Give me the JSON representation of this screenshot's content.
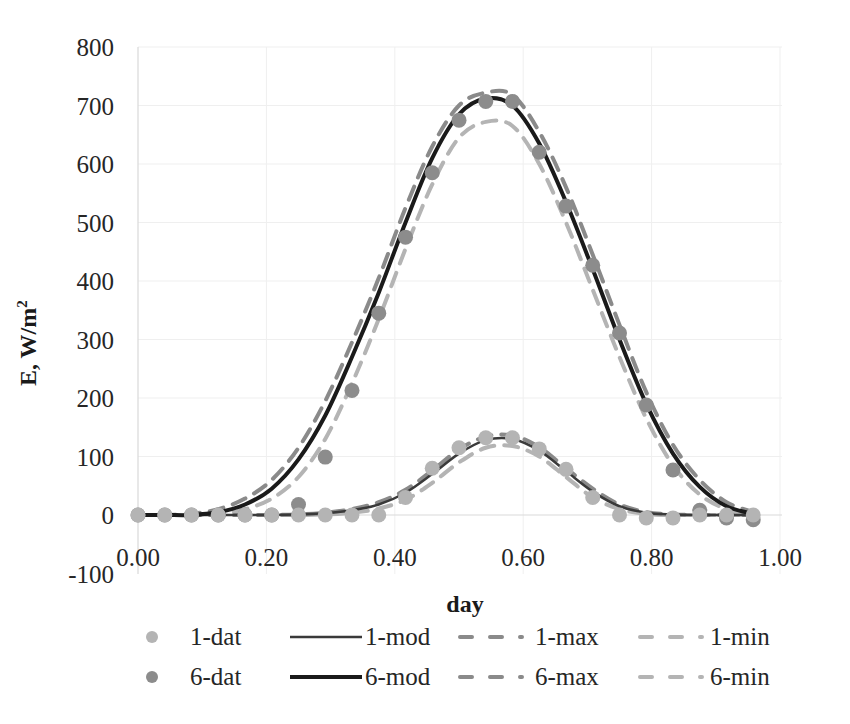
{
  "chart_data": {
    "type": "line",
    "title": "",
    "xlabel": "day",
    "ylabel": "E, W/m²",
    "xlim": [
      0,
      1
    ],
    "ylim": [
      -100,
      800
    ],
    "grid": true,
    "legend_position": "bottom",
    "x_ticks": [
      "0.00",
      "0.20",
      "0.40",
      "0.60",
      "0.80",
      "1.00"
    ],
    "y_ticks": [
      "-100",
      "0",
      "100",
      "200",
      "300",
      "400",
      "500",
      "600",
      "700",
      "800"
    ],
    "x": [
      0,
      0.0417,
      0.0833,
      0.125,
      0.1667,
      0.2083,
      0.25,
      0.2917,
      0.3333,
      0.375,
      0.4167,
      0.4583,
      0.5,
      0.5417,
      0.5833,
      0.625,
      0.6667,
      0.7083,
      0.75,
      0.7917,
      0.8333,
      0.875,
      0.9167,
      0.9583
    ],
    "series": [
      {
        "name": "1-dat",
        "kind": "markers",
        "color": "#b4b4b4",
        "values": [
          0,
          0,
          0,
          0,
          0,
          0,
          0,
          0,
          0,
          0,
          30,
          80,
          115,
          132,
          132,
          113,
          78,
          30,
          0,
          -5,
          -5,
          0,
          0,
          0
        ]
      },
      {
        "name": "6-dat",
        "kind": "markers",
        "color": "#8c8c8c",
        "values": [
          0,
          0,
          0,
          0,
          0,
          0,
          18,
          0,
          0,
          0,
          0,
          0,
          0,
          0,
          0,
          0,
          0,
          0,
          0,
          0,
          0,
          0,
          0,
          0
        ],
        "values_main": [
          0,
          0,
          0,
          0,
          0,
          0,
          18,
          99,
          213,
          345,
          475,
          585,
          675,
          707,
          707,
          620,
          528,
          427,
          311,
          188,
          77,
          8,
          -5,
          -8
        ]
      },
      {
        "name": "1-mod",
        "kind": "solid",
        "color": "#3a3a3a",
        "width": 2.5,
        "values": [
          0,
          0,
          0,
          0,
          0,
          0,
          1,
          3,
          8,
          18,
          38,
          70,
          105,
          128,
          130,
          110,
          75,
          40,
          15,
          4,
          1,
          0,
          0,
          0
        ]
      },
      {
        "name": "6-mod",
        "kind": "solid",
        "color": "#1a1a1a",
        "width": 4,
        "values": [
          0,
          0,
          0,
          5,
          18,
          45,
          95,
          170,
          270,
          380,
          500,
          610,
          685,
          712,
          700,
          635,
          535,
          420,
          300,
          190,
          105,
          48,
          15,
          2
        ]
      },
      {
        "name": "1-max",
        "kind": "dashed",
        "color": "#8a8a8a",
        "width": 4,
        "values": [
          0,
          0,
          0,
          0,
          0,
          0,
          1,
          4,
          10,
          22,
          43,
          76,
          112,
          134,
          136,
          116,
          80,
          45,
          18,
          5,
          1,
          0,
          0,
          0
        ]
      },
      {
        "name": "6-max",
        "kind": "dashed",
        "color": "#8a8a8a",
        "width": 4,
        "values": [
          0,
          0,
          2,
          10,
          28,
          60,
          115,
          195,
          295,
          405,
          525,
          630,
          700,
          722,
          718,
          655,
          560,
          445,
          325,
          210,
          120,
          60,
          22,
          5
        ]
      },
      {
        "name": "1-min",
        "kind": "dashed",
        "color": "#b4b4b4",
        "width": 4,
        "values": [
          0,
          0,
          0,
          0,
          0,
          0,
          0,
          1,
          4,
          11,
          26,
          55,
          90,
          115,
          118,
          100,
          65,
          30,
          10,
          2,
          0,
          0,
          0,
          0
        ]
      },
      {
        "name": "6-min",
        "kind": "dashed",
        "color": "#b4b4b4",
        "width": 4,
        "values": [
          0,
          0,
          0,
          2,
          10,
          28,
          65,
          130,
          225,
          335,
          455,
          565,
          645,
          672,
          665,
          600,
          500,
          385,
          270,
          165,
          85,
          35,
          10,
          0
        ]
      }
    ],
    "legend": [
      [
        "1-dat",
        "1-mod",
        "1-max",
        "1-min"
      ],
      [
        "6-dat",
        "6-mod",
        "6-max",
        "6-min"
      ]
    ]
  }
}
